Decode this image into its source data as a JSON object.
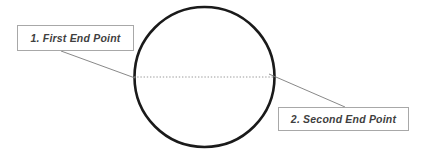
{
  "canvas": {
    "width": 421,
    "height": 153,
    "background_color": "#ffffff"
  },
  "figure": {
    "shape": "circle",
    "stroke_color": "#1a1a1a",
    "stroke_width": 2.6,
    "center_x": 204.5,
    "center_y": 77,
    "radius": 70
  },
  "diameter_line": {
    "name": "diameter-dotted-line",
    "color": "#9a9a9a",
    "style": "dotted",
    "x1": 134,
    "y1": 77,
    "x2": 275,
    "y2": 77
  },
  "callouts": [
    {
      "id": "first-end-point",
      "label": "1. First End Point",
      "box_x": 17,
      "box_y": 25,
      "box_width": 117,
      "box_height": 26,
      "border_color": "#a8a8a8",
      "text_color": "#3f3f3f",
      "leader_line": {
        "name": "leader-line-first",
        "color": "#7a7a7a",
        "x1": 61,
        "y1": 51,
        "x2": 135,
        "y2": 78
      }
    },
    {
      "id": "second-end-point",
      "label": "2. Second End Point",
      "box_x": 278,
      "box_y": 107,
      "box_width": 131,
      "box_height": 24,
      "border_color": "#a8a8a8",
      "text_color": "#3f3f3f",
      "leader_line": {
        "name": "leader-line-second",
        "color": "#7a7a7a",
        "x1": 269,
        "y1": 74,
        "x2": 345,
        "y2": 107
      }
    }
  ]
}
